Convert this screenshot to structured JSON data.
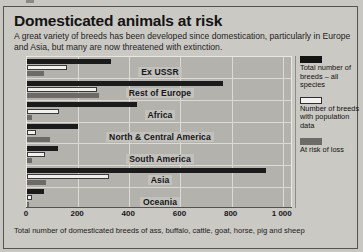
{
  "header": {
    "title": "Domesticated animals at risk",
    "subtitle": "A great variety of breeds has been developed since domestication, particularly in Europe and Asia, but many are now threatened with extinction."
  },
  "footnote": "Total number of domesticated breeds of ass, buffalo, cattle, goat, horse, pig and sheep",
  "legend": {
    "items": [
      {
        "key": "total",
        "label": "Total number of breeds – all species",
        "color": "#141414"
      },
      {
        "key": "pop",
        "label": "Number of breeds with population data",
        "color": "#f4f2ee"
      },
      {
        "key": "risk",
        "label": "At risk of loss",
        "color": "#6d6b67"
      }
    ]
  },
  "chart_data": {
    "type": "bar",
    "orientation": "horizontal",
    "title": "Domesticated animals at risk",
    "xlabel": "Total number of domesticated breeds of ass, buffalo, cattle, goat, horse, pig and sheep",
    "ylabel": "",
    "xlim": [
      0,
      1040
    ],
    "xticks": [
      0,
      200,
      400,
      600,
      800,
      1000
    ],
    "xticklabels": [
      "0",
      "200",
      "400",
      "600",
      "800",
      "1 000"
    ],
    "grid": true,
    "legend_position": "right",
    "categories": [
      "Ex USSR",
      "Rest of Europe",
      "Africa",
      "North & Central America",
      "South America",
      "Asia",
      "Oceania"
    ],
    "series": [
      {
        "name": "Total number of breeds – all species",
        "color": "#141414",
        "values": [
          330,
          765,
          430,
          200,
          120,
          935,
          65
        ]
      },
      {
        "name": "Number of breeds with population data",
        "color": "#f4f2ee",
        "values": [
          155,
          275,
          125,
          35,
          70,
          320,
          20
        ]
      },
      {
        "name": "At risk of loss",
        "color": "#6d6b67",
        "values": [
          65,
          280,
          20,
          90,
          20,
          75,
          8
        ]
      }
    ]
  }
}
